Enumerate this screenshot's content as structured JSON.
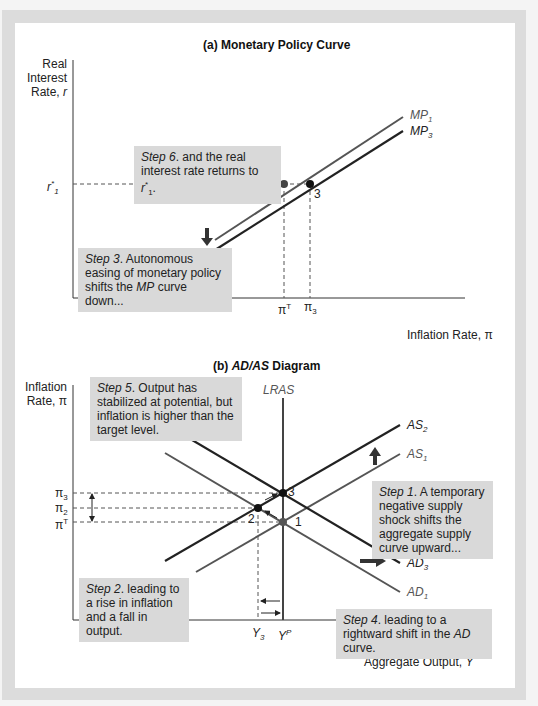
{
  "panel_a": {
    "title": "(a) Monetary Policy Curve",
    "y_axis_label": [
      "Real",
      "Interest",
      "Rate, r"
    ],
    "x_axis_label": "Inflation Rate, π",
    "r_tick": "r*1",
    "x_ticks": [
      "πT",
      "π3"
    ],
    "curves": [
      "MP1",
      "MP3"
    ],
    "points": [
      "1",
      "3"
    ],
    "step6": {
      "step": "Step 6",
      "text": ". and the real interest rate returns to r*1."
    },
    "step3": {
      "step": "Step 3",
      "text": ". Autonomous easing of monetary policy shifts the MP curve down..."
    }
  },
  "panel_b": {
    "title": "(b) AD/AS Diagram",
    "y_axis_label": [
      "Inflation",
      "Rate, π"
    ],
    "x_axis_label": "Aggregate Output, Y",
    "y_ticks": [
      "π3",
      "π2",
      "πT"
    ],
    "x_ticks": [
      "Y3",
      "YP"
    ],
    "curves": [
      "LRAS",
      "AS2",
      "AS1",
      "AD3",
      "AD1"
    ],
    "points": [
      "1",
      "2",
      "3"
    ],
    "step5": {
      "step": "Step 5",
      "text": ". Output has stabilized at potential, but inflation is higher than the target level."
    },
    "step1": {
      "step": "Step 1",
      "text": ". A temporary negative supply shock shifts the aggregate supply curve upward..."
    },
    "step2": {
      "step": "Step 2",
      "text": ". leading to a rise in inflation and a fall in output."
    },
    "step4": {
      "step": "Step 4",
      "text": ". leading to a rightward shift in the AD curve."
    }
  },
  "colors": {
    "dark_curve": "#222222",
    "light_curve": "#555555",
    "box_bg": "#d9d9d9",
    "frame": "#dcdcdc"
  }
}
